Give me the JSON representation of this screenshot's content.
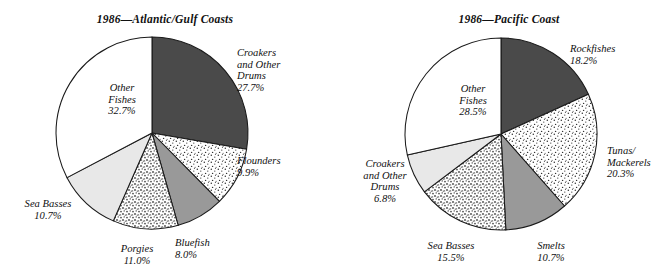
{
  "figure": {
    "width": 671,
    "height": 277,
    "background": "#ffffff"
  },
  "palette": {
    "dark_gray": "#4a4a4a",
    "medium_gray": "#999999",
    "light_gray": "#e8e8e8",
    "white": "#ffffff",
    "outline": "#1a1a1a",
    "text": "#101010"
  },
  "charts": [
    {
      "id": "atlantic-gulf",
      "title": "1986—Atlantic/Gulf Coasts",
      "center_x": 152,
      "center_y": 133,
      "radius": 96,
      "slices": [
        {
          "label": "Croakers\nand Other\nDrums",
          "value": 27.7,
          "value_text": "27.7%",
          "fill": "dark_gray",
          "pattern": "solid",
          "label_x": 237,
          "label_y": 47,
          "align": "rgt"
        },
        {
          "label": "Flounders",
          "value": 9.9,
          "value_text": "9.9%",
          "fill": "white",
          "pattern": "dots",
          "label_x": 237,
          "label_y": 155,
          "align": "rgt"
        },
        {
          "label": "Bluefish",
          "value": 8.0,
          "value_text": "8.0%",
          "fill": "medium_gray",
          "pattern": "solid",
          "label_x": 175,
          "label_y": 237,
          "align": "rgt"
        },
        {
          "label": "Porgies",
          "value": 11.0,
          "value_text": "11.0%",
          "fill": "white",
          "pattern": "stipple",
          "label_x": 99,
          "label_y": 243,
          "align": "ctr"
        },
        {
          "label": "Sea Basses",
          "value": 10.7,
          "value_text": "10.7%",
          "fill": "light_gray",
          "pattern": "solid",
          "label_x": 10,
          "label_y": 198,
          "align": "ctr"
        },
        {
          "label": "Other\nFishes",
          "value": 32.7,
          "value_text": "32.7%",
          "fill": "white",
          "pattern": "solid",
          "label_x": 84,
          "label_y": 82,
          "align": "ctr"
        }
      ]
    },
    {
      "id": "pacific",
      "title": "1986—Pacific Coast",
      "center_x": 501,
      "center_y": 134,
      "radius": 96,
      "slices": [
        {
          "label": "Rockfishes",
          "value": 18.2,
          "value_text": "18.2%",
          "fill": "dark_gray",
          "pattern": "solid",
          "label_x": 570,
          "label_y": 43,
          "align": "rgt"
        },
        {
          "label": "Tunas/\nMackerels",
          "value": 20.3,
          "value_text": "20.3%",
          "fill": "white",
          "pattern": "dots",
          "label_x": 607,
          "label_y": 145,
          "align": "rgt"
        },
        {
          "label": "Smelts",
          "value": 10.7,
          "value_text": "10.7%",
          "fill": "medium_gray",
          "pattern": "solid",
          "label_x": 513,
          "label_y": 240,
          "align": "ctr"
        },
        {
          "label": "Sea Basses",
          "value": 15.5,
          "value_text": "15.5%",
          "fill": "white",
          "pattern": "stipple",
          "label_x": 413,
          "label_y": 240,
          "align": "ctr"
        },
        {
          "label": "Croakers\nand Other\nDrums",
          "value": 6.8,
          "value_text": "6.8%",
          "fill": "light_gray",
          "pattern": "solid",
          "label_x": 347,
          "label_y": 158,
          "align": "ctr"
        },
        {
          "label": "Other\nFishes",
          "value": 28.5,
          "value_text": "28.5%",
          "fill": "white",
          "pattern": "solid",
          "label_x": 435,
          "label_y": 83,
          "align": "ctr"
        }
      ]
    }
  ],
  "chart_data": [
    {
      "type": "pie",
      "title": "1986—Atlantic/Gulf Coasts",
      "categories": [
        "Croakers and Other Drums",
        "Flounders",
        "Bluefish",
        "Porgies",
        "Sea Basses",
        "Other Fishes"
      ],
      "values": [
        27.7,
        9.9,
        8.0,
        11.0,
        10.7,
        32.7
      ],
      "unit": "percent",
      "start_angle_deg": 0,
      "direction": "clockwise",
      "legend": "none",
      "labels_position": "outside-and-inside",
      "slice_styles": [
        "solid dark gray",
        "white with fine dots",
        "solid medium gray",
        "white with coarse stipple",
        "solid light gray",
        "plain white"
      ]
    },
    {
      "type": "pie",
      "title": "1986—Pacific Coast",
      "categories": [
        "Rockfishes",
        "Tunas/Mackerels",
        "Smelts",
        "Sea Basses",
        "Croakers and Other Drums",
        "Other Fishes"
      ],
      "values": [
        18.2,
        20.3,
        10.7,
        15.5,
        6.8,
        28.5
      ],
      "unit": "percent",
      "start_angle_deg": 0,
      "direction": "clockwise",
      "legend": "none",
      "labels_position": "outside-and-inside",
      "slice_styles": [
        "solid dark gray",
        "white with fine dots",
        "solid medium gray",
        "white with coarse stipple",
        "solid light gray",
        "plain white"
      ]
    }
  ]
}
